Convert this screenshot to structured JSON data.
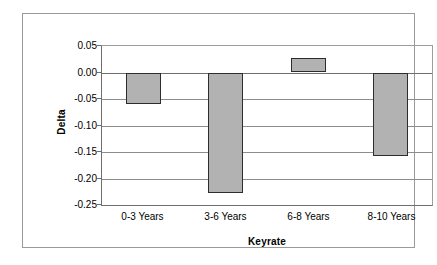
{
  "chart_data": {
    "type": "bar",
    "title": "",
    "categories": [
      "0-3 Years",
      "3-6 Years",
      "6-8 Years",
      "8-10 Years"
    ],
    "values": [
      -0.06,
      -0.228,
      0.027,
      -0.158
    ],
    "xlabel": "Keyrate",
    "ylabel": "Delta",
    "ylim": [
      -0.25,
      0.05
    ],
    "yticks": [
      0.05,
      0.0,
      -0.05,
      -0.1,
      -0.15,
      -0.2,
      -0.25
    ],
    "ytick_labels": [
      "0.05",
      "0.00",
      "-0.05",
      "-0.10",
      "-0.15",
      "-0.20",
      "-0.25"
    ],
    "grid": true,
    "legend": false,
    "bar_fill_color": "#b2b2b2",
    "bar_border_color": "#2d2d2d",
    "gridline_color": "#8d8d8d",
    "frame_color": "#9a9a9a",
    "plot_background": "#ffffff"
  }
}
